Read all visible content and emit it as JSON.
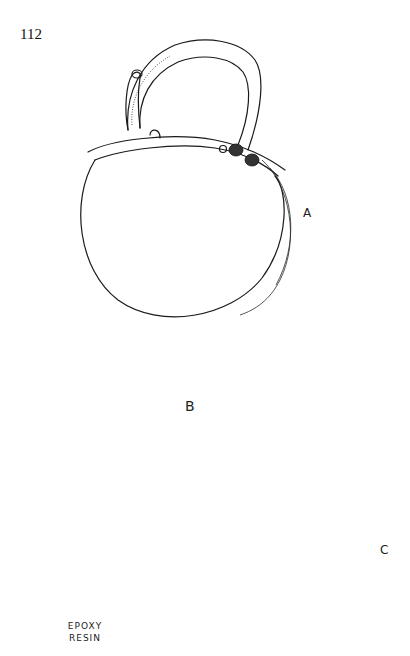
{
  "page": {
    "page_number": "112"
  },
  "figures": {
    "A": {
      "label": "A",
      "description": "Round box/locket with hinged loop handle, side view"
    },
    "B": {
      "label": "B",
      "description": "Two decorative rosette disc patterns with beaded borders and leaf motifs"
    },
    "C": {
      "label": "C",
      "description": "Cross-section profile of lid and base fitting"
    }
  },
  "annotations": {
    "epoxy_line1": "EPOXY",
    "epoxy_line2": "RESIN"
  }
}
